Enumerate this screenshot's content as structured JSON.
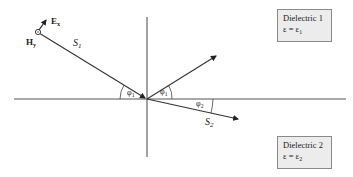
{
  "diagram": {
    "type": "oblique incidence at dielectric interface",
    "colors": {
      "lines": "#333333",
      "box_bg": "#ececec",
      "box_border": "#8a8a8a"
    },
    "labels": {
      "H_field": "H",
      "H_sub": "y",
      "E_field": "E",
      "E_sub": "x",
      "incident_ray": "S",
      "incident_sub": "1",
      "transmitted_ray": "S",
      "transmitted_sub": "2",
      "angle_incident": "φ",
      "angle_incident_sub": "1",
      "angle_reflected": "φ",
      "angle_reflected_sub": "1",
      "angle_reflected_prime": "′",
      "angle_transmitted": "φ",
      "angle_transmitted_sub": "2"
    },
    "medium1": {
      "name": "Dielectric 1",
      "eq": "ε = ε",
      "eq_sub": "1"
    },
    "medium2": {
      "name": "Dielectric 2",
      "eq": "ε = ε",
      "eq_sub": "2"
    }
  }
}
